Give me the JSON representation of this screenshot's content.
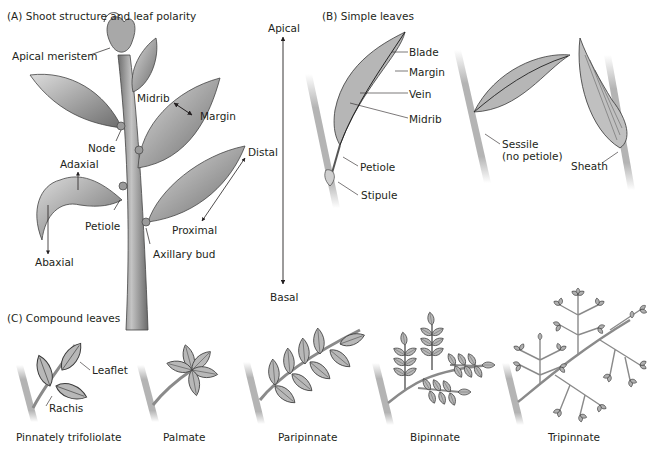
{
  "panel_a": {
    "title": "(A)  Shoot structure and leaf polarity",
    "labels": {
      "apical_meristem": "Apical meristem",
      "midrib": "Midrib",
      "margin": "Margin",
      "node": "Node",
      "adaxial": "Adaxial",
      "abaxial": "Abaxial",
      "petiole": "Petiole",
      "distal": "Distal",
      "proximal": "Proximal",
      "axillary_bud": "Axillary bud"
    }
  },
  "axis": {
    "top": "Apical",
    "bottom": "Basal"
  },
  "panel_b": {
    "title": "(B)  Simple leaves",
    "labels": {
      "blade": "Blade",
      "margin": "Margin",
      "vein": "Vein",
      "midrib": "Midrib",
      "petiole": "Petiole",
      "stipule": "Stipule",
      "sessile_line1": "Sessile",
      "sessile_line2": "(no petiole)",
      "sheath": "Sheath"
    }
  },
  "panel_c": {
    "title": "(C)  Compound leaves",
    "labels": {
      "leaflet": "Leaflet",
      "rachis": "Rachis"
    },
    "captions": [
      "Pinnately trifoliolate",
      "Palmate",
      "Paripinnate",
      "Bipinnate",
      "Tripinnate"
    ]
  },
  "colors": {
    "text": "#231f20",
    "leaf_fill": "#b8b8b8",
    "leaf_shade": "#8c8c8c",
    "stem": "#a8a8a8",
    "outline": "#3a3a3a"
  }
}
